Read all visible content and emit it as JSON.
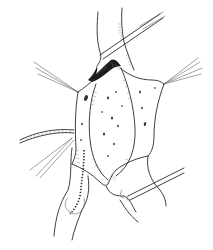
{
  "image": {
    "kind": "surgical line illustration",
    "style": "black ink line drawing on white background",
    "background_color": "#ffffff",
    "ink_color": "#2a2a2a",
    "text": []
  },
  "elements": {
    "central_field": "retracted opening with stippled inner surface",
    "instruments": [
      "forceps-top",
      "retractor-bottom-right"
    ],
    "stay_sutures": [
      "suture-upper-left",
      "suture-right",
      "suture-lower-left"
    ],
    "suture_thread": "braided thread from left edge",
    "dashed_line": "dotted incision line on lower-left structure"
  }
}
